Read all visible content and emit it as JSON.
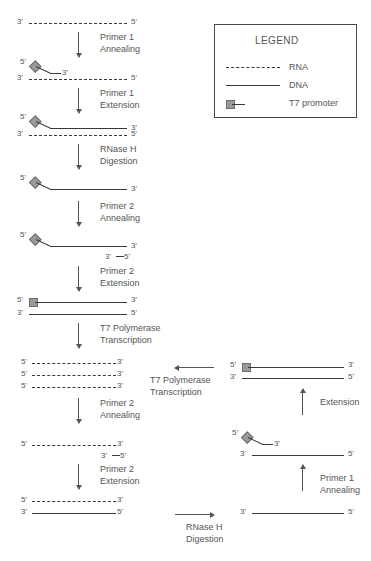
{
  "figure": {
    "caption": "",
    "title": ""
  },
  "legend": {
    "title": "LEGEND",
    "items": [
      {
        "key": "rna-swatch",
        "label": "RNA"
      },
      {
        "key": "dna-swatch",
        "label": "DNA"
      },
      {
        "key": "t7-swatch",
        "label": "T7 promoter"
      }
    ]
  },
  "ends": {
    "three_prime": "3'",
    "five_prime": "5'"
  },
  "left_column": {
    "steps": [
      {
        "id": "primer1-annealing",
        "line1": "Primer 1",
        "line2": "Annealing"
      },
      {
        "id": "primer1-extension",
        "line1": "Primer 1",
        "line2": "Extension"
      },
      {
        "id": "rnaseh-digestion",
        "line1": "RNase H",
        "line2": "Digestion"
      },
      {
        "id": "primer2-annealing",
        "line1": "Primer 2",
        "line2": "Annealing"
      },
      {
        "id": "primer2-extension",
        "line1": "Primer 2",
        "line2": "Extension"
      },
      {
        "id": "t7-transcription",
        "line1": "T7 Polymerase",
        "line2": "Transcription"
      },
      {
        "id": "primer2-annealing-2",
        "line1": "Primer 2",
        "line2": "Annealing"
      },
      {
        "id": "primer2-extension-2",
        "line1": "Primer 2",
        "line2": "Extension"
      }
    ],
    "stages": [
      {
        "id": "stage-1-rna-template",
        "desc": "RNA template 3' to 5'"
      },
      {
        "id": "stage-2-primer1-annealed",
        "desc": "Primer 1 annealed to RNA template"
      },
      {
        "id": "stage-3-cdna-extended",
        "desc": "cDNA extended on RNA template"
      },
      {
        "id": "stage-4-cdna-single",
        "desc": "Single stranded cDNA after RNase H"
      },
      {
        "id": "stage-5-primer2-annealed",
        "desc": "Primer 2 annealed to cDNA 3' end"
      },
      {
        "id": "stage-6-dsdna-t7",
        "desc": "Double stranded DNA with T7 promoter"
      },
      {
        "id": "stage-7-rna-amplicons",
        "desc": "Three antisense RNA copies"
      },
      {
        "id": "stage-8-primer2-on-rna",
        "desc": "Primer 2 annealed to RNA copy"
      },
      {
        "id": "stage-9-rna-dna-hybrid",
        "desc": "RNA DNA hybrid after extension"
      }
    ]
  },
  "right_column": {
    "steps": [
      {
        "id": "t7-transcription-right",
        "line1": "T7 Polymerase",
        "line2": "Transcription"
      },
      {
        "id": "extension-right",
        "line1": "Extension",
        "line2": ""
      },
      {
        "id": "primer1-annealing-right",
        "line1": "Primer 1",
        "line2": "Annealing"
      },
      {
        "id": "rnaseh-digestion-right",
        "line1": "RNase H",
        "line2": "Digestion"
      }
    ],
    "stages": [
      {
        "id": "stage-r1-dsdna-t7",
        "desc": "Double stranded DNA with T7 promoter"
      },
      {
        "id": "stage-r2-primer1-annealed",
        "desc": "Primer 1 annealed to cDNA"
      },
      {
        "id": "stage-r3-cdna-single",
        "desc": "Single stranded cDNA after RNase H digestion"
      }
    ]
  },
  "colors": {
    "strand": "#3a3a3a",
    "text": "#555555",
    "promoter_fill": "#9a9a9a",
    "promoter_stroke": "#6d6d6d",
    "legend_border": "#4a4a4a",
    "background": "#ffffff"
  }
}
